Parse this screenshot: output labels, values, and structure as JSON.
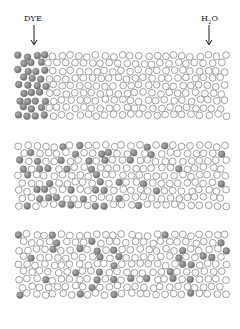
{
  "labels": {
    "dye": "DYE",
    "water_main": "H",
    "water_sub": "2",
    "water_tail": "O"
  },
  "colors": {
    "dye_fill": "#7a7a7a",
    "dye_highlight": "#b0b0b0",
    "water_stroke": "#8a8a8a",
    "arrow": "#222222"
  },
  "panels": [
    {
      "name": "initial",
      "top": 53,
      "bottom": 121,
      "dye_mode": "left",
      "dye_boundary": 48,
      "seed": 7
    },
    {
      "name": "intermediate",
      "top": 143,
      "bottom": 212,
      "dye_mode": "gradient",
      "seed": 19
    },
    {
      "name": "equilibrium",
      "top": 232,
      "bottom": 302,
      "dye_mode": "uniform",
      "seed": 41
    }
  ],
  "layout": {
    "x_min": 19,
    "x_max": 227,
    "radius": 3.4,
    "spacing": 8.6
  }
}
